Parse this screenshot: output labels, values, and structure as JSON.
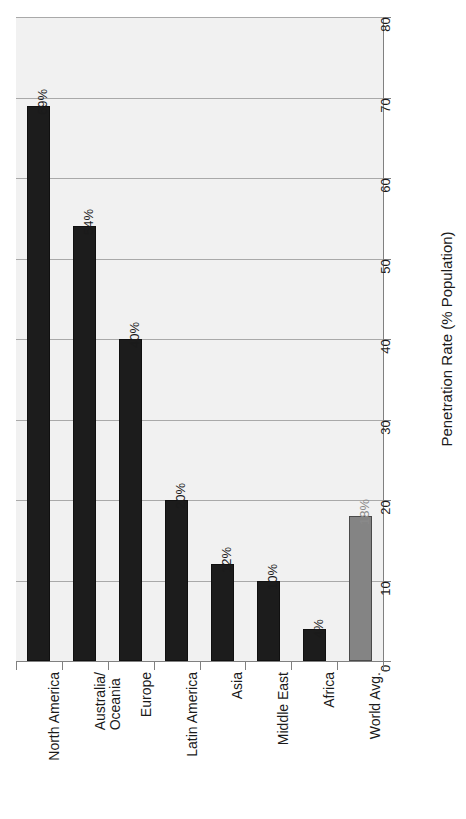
{
  "chart_data": {
    "type": "bar",
    "title": "",
    "subtitle": "",
    "orientation": "vertical-bars-rotated-90",
    "categories": [
      "North America",
      "Australia/\nOceania",
      "Europe",
      "Latin America",
      "Asia",
      "Middle East",
      "Africa",
      "World Avg."
    ],
    "values": [
      69,
      54,
      40,
      20,
      12,
      10,
      4,
      18
    ],
    "data_labels": [
      "69%",
      "54%",
      "40%",
      "20%",
      "12%",
      "10%",
      "4%",
      "18%"
    ],
    "series": [
      {
        "name": "Penetration Rate",
        "values": [
          69,
          54,
          40,
          20,
          12,
          10,
          4,
          18
        ]
      }
    ],
    "bar_styles": [
      "dark",
      "dark",
      "dark",
      "dark",
      "dark",
      "dark",
      "dark",
      "light"
    ],
    "xlabel": "",
    "ylabel": "Penetration Rate (% Population)",
    "ylim": [
      0,
      80
    ],
    "ytick_step": 10,
    "ytick_labels": [
      "0",
      "10",
      "20",
      "30",
      "40",
      "50",
      "60",
      "70",
      "80"
    ],
    "ytick_values": [
      0,
      10,
      20,
      30,
      40,
      50,
      60,
      70,
      80
    ],
    "grid": "horizontal",
    "legend": "none",
    "colors": {
      "bar_dark": "#1c1c1c",
      "bar_light": "#848484",
      "plot_background": "#f1f1f1",
      "gridline": "#a9a9a9",
      "axis": "#808080",
      "text": "#1a1a1a",
      "muted_label": "#8a8a8a",
      "figure_background": "#ffffff"
    }
  }
}
